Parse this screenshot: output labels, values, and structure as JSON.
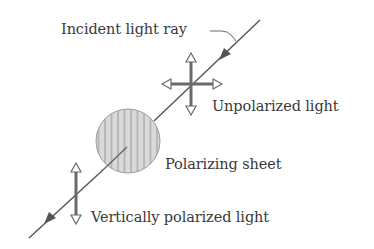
{
  "diagram": {
    "labels": {
      "incident": "Incident light ray",
      "unpolarized": "Unpolarized light",
      "sheet": "Polarizing sheet",
      "vertical": "Vertically polarized light"
    },
    "colors": {
      "line": "#555555",
      "arrow_stroke": "#666666",
      "sheet_fill": "#d8d8d8",
      "sheet_lines": "#8a8a8a",
      "text": "#3a3a3a",
      "background": "#ffffff"
    },
    "icons": {
      "unpolarized": "four-way-arrow-icon",
      "vertical": "vertical-double-arrow-icon",
      "ray_direction": "arrowhead-icon"
    }
  }
}
